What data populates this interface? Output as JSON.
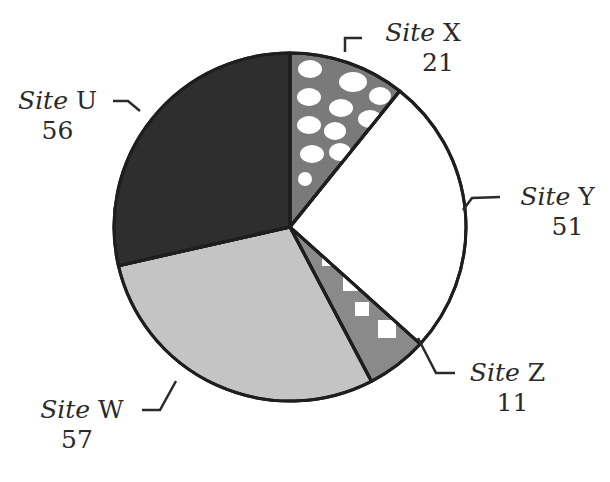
{
  "chart_data": {
    "type": "pie",
    "title": "",
    "categories": [
      "Site X",
      "Site Y",
      "Site Z",
      "Site W",
      "Site U"
    ],
    "values": [
      21,
      51,
      11,
      57,
      56
    ],
    "start_angle": "12 o'clock, clockwise",
    "slice_styles": [
      {
        "name": "Site X",
        "fill": "#7a7a7a",
        "pattern": "white ovals"
      },
      {
        "name": "Site Y",
        "fill": "#ffffff",
        "pattern": "none"
      },
      {
        "name": "Site Z",
        "fill": "#8a8a8a",
        "pattern": "white squares"
      },
      {
        "name": "Site W",
        "fill": "#c4c4c4",
        "pattern": "none"
      },
      {
        "name": "Site U",
        "fill": "#2e2e2e",
        "pattern": "none"
      }
    ],
    "legend": "none (labels with leader lines)"
  },
  "labels": {
    "x": {
      "word": "Site",
      "letter": "X",
      "value": "21"
    },
    "y": {
      "word": "Site",
      "letter": "Y",
      "value": "51"
    },
    "z": {
      "word": "Site",
      "letter": "Z",
      "value": "11"
    },
    "w": {
      "word": "Site",
      "letter": "W",
      "value": "57"
    },
    "u": {
      "word": "Site",
      "letter": "U",
      "value": "56"
    }
  }
}
